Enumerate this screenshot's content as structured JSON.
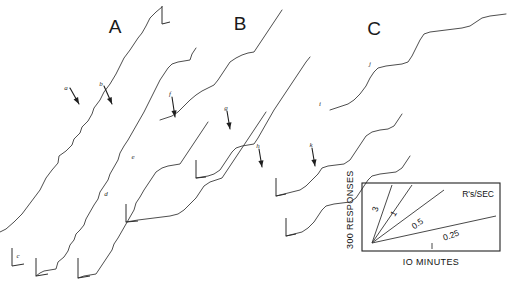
{
  "figure": {
    "type": "cumulative-record",
    "background": "#ffffff",
    "ink_color": "#3a3a3a",
    "width": 512,
    "height": 284
  },
  "panels": [
    {
      "label": "A",
      "x": 115,
      "y": 33
    },
    {
      "label": "B",
      "x": 240,
      "y": 30
    },
    {
      "label": "C",
      "x": 374,
      "y": 35
    }
  ],
  "annotations": [
    {
      "letter": "a",
      "x": 66,
      "y": 90,
      "has_arrow": true,
      "arrow": {
        "x1": 70,
        "y1": 88,
        "x2": 79,
        "y2": 104
      }
    },
    {
      "letter": "b",
      "x": 101,
      "y": 86,
      "has_arrow": true,
      "arrow": {
        "x1": 104,
        "y1": 86,
        "x2": 112,
        "y2": 104
      }
    },
    {
      "letter": "c",
      "x": 18,
      "y": 258,
      "has_arrow": false,
      "arrow": null
    },
    {
      "letter": "d",
      "x": 106,
      "y": 196,
      "has_arrow": false,
      "arrow": null
    },
    {
      "letter": "e",
      "x": 133,
      "y": 159,
      "has_arrow": false,
      "arrow": null
    },
    {
      "letter": "f",
      "x": 170,
      "y": 96,
      "has_arrow": true,
      "arrow": {
        "x1": 172,
        "y1": 97,
        "x2": 175,
        "y2": 117
      }
    },
    {
      "letter": "g",
      "x": 226,
      "y": 110,
      "has_arrow": true,
      "arrow": {
        "x1": 227,
        "y1": 111,
        "x2": 230,
        "y2": 129
      }
    },
    {
      "letter": "h",
      "x": 258,
      "y": 148,
      "has_arrow": true,
      "arrow": {
        "x1": 259,
        "y1": 149,
        "x2": 262,
        "y2": 167
      }
    },
    {
      "letter": "i",
      "x": 320,
      "y": 106,
      "has_arrow": false,
      "arrow": null
    },
    {
      "letter": "j",
      "x": 370,
      "y": 66,
      "has_arrow": false,
      "arrow": null
    },
    {
      "letter": "k",
      "x": 311,
      "y": 147,
      "has_arrow": true,
      "arrow": {
        "x1": 312,
        "y1": 148,
        "x2": 315,
        "y2": 166
      }
    }
  ],
  "records": [
    {
      "id": "a-top",
      "points": "0,232 6,229 14,222 22,214 28,206 34,198 40,190 46,178 52,170 58,163 59,156 66,151 72,145 74,139 80,133 82,127 88,121 92,114 94,108 100,100 104,92 110,84 116,74 120,66 124,58 130,50 134,44 138,38 142,33 146,26 150,18 156,12 162,7"
    },
    {
      "id": "a-mid",
      "points": "36,276 40,273 44,271 50,270 56,269 58,262 64,257 68,251 70,245 74,240 76,234 80,230 84,225 86,219 90,212 94,205 98,199 100,192 104,186 108,180 110,174 114,167 118,160 120,153 124,146 128,140 132,133 136,126 140,119 144,112 148,104 152,96 156,88 160,80 164,74 168,68 172,64 178,62 184,61 190,60 192,54 196,48"
    },
    {
      "id": "a-low",
      "points": "78,278 84,276 90,275 96,274 100,268 104,262 108,256 112,250 114,244 118,238 122,231 126,224 130,217 134,210 136,203 140,197 144,190 148,184 152,178 156,172 162,168 168,166 174,165 180,164 184,158 188,152 192,146 196,140 200,134 204,128 208,122"
    },
    {
      "id": "b-top",
      "points": "160,120 166,118 172,116 178,112 184,106 190,100 196,95 202,91 208,88 214,85 218,80 222,74 226,68 230,62 236,58 242,55 248,53 254,52 258,46 262,40 266,34 270,28 274,22 278,16 282,10"
    },
    {
      "id": "b-mid",
      "points": "196,178 202,177 208,176 214,174 220,170 224,164 228,158 232,152 236,148 242,146 248,145 254,144 258,138 262,131 266,124 270,117 274,110 278,104 282,98 286,92 290,86 294,80 298,74 302,68 306,62 310,57"
    },
    {
      "id": "b-low",
      "points": "126,222 132,221 138,220 146,219 154,218 162,217 170,216 178,214 184,210 190,204 196,198 200,192 204,186 210,182 216,180 222,178 226,172 230,166 234,160 238,154 242,148 246,142 250,136 254,130 258,124 262,118 266,112"
    },
    {
      "id": "c-top",
      "points": "330,110 336,108 342,106 348,104 354,100 360,94 366,86 370,78 374,72 378,68 386,66 394,65 402,64 408,62 412,56 416,48 420,40 424,34 430,32 438,31 446,30 454,29 462,28 470,26 476,22 482,18 490,16 498,15 506,14"
    },
    {
      "id": "c-mid",
      "points": "276,196 284,194 292,192 300,190 306,186 312,180 318,174 322,168 328,166 336,165 344,164 350,160 354,154 358,148 362,142 366,136 372,132 380,130 388,129 394,126 398,120 402,114"
    },
    {
      "id": "c-low",
      "points": "286,236 294,234 302,232 308,228 314,222 318,216 322,210 326,206 334,204 342,203 350,202 356,198 360,192 364,186 368,180 372,176 380,174 388,173 396,172 402,168 406,162 410,156"
    }
  ],
  "reset_marks": [
    {
      "id": "reset-1",
      "points": "12,248 12,266 24,264"
    },
    {
      "id": "reset-2",
      "points": "36,258 36,276 48,274"
    },
    {
      "id": "reset-3",
      "points": "78,258 78,278 90,276"
    },
    {
      "id": "reset-4",
      "points": "126,204 126,222 138,221"
    },
    {
      "id": "reset-5",
      "points": "162,6  162,24  170,22"
    },
    {
      "id": "reset-6",
      "points": "196,160 196,178 206,177"
    },
    {
      "id": "reset-7",
      "points": "276,178 276,196 286,194"
    },
    {
      "id": "reset-8",
      "points": "286,218 286,236 296,234"
    }
  ],
  "legend": {
    "box": {
      "x": 362,
      "y": 183,
      "width": 138,
      "height": 68
    },
    "y_axis_label": "300 RESPONSES",
    "x_axis_label": "IO MINUTES",
    "rate_units_label": "R's/SEC",
    "rate_lines": [
      {
        "label": "3",
        "x2": 392,
        "y2": 185,
        "label_x": 378,
        "label_y": 210,
        "label_rotate": -72
      },
      {
        "label": "1",
        "x2": 412,
        "y2": 185,
        "label_x": 396,
        "label_y": 215,
        "label_rotate": -58
      },
      {
        "label": "0.5",
        "x2": 444,
        "y2": 190,
        "label_x": 419,
        "label_y": 226,
        "label_rotate": -35
      },
      {
        "label": "0.25",
        "x2": 496,
        "y2": 216,
        "label_x": 452,
        "label_y": 238,
        "label_rotate": -20
      }
    ],
    "origin": {
      "x": 372,
      "y": 243
    },
    "tick": {
      "x": 432,
      "y1": 243,
      "y2": 249
    }
  }
}
